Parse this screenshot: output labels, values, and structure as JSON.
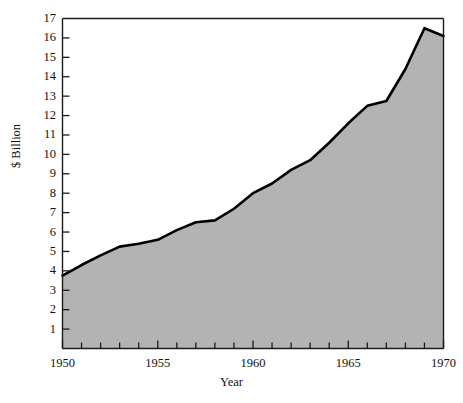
{
  "chart_data": {
    "type": "area",
    "title": "",
    "xlabel": "Year",
    "ylabel": "$ Billion",
    "xlim": [
      1950,
      1970
    ],
    "ylim": [
      0,
      17
    ],
    "grid": false,
    "legend": null,
    "fill_color": "#b3b3b3",
    "line_color": "#000000",
    "background_color": "#ffffff",
    "x_tick_labels": [
      "1950",
      "1955",
      "1960",
      "1965",
      "1970"
    ],
    "x_tick_values": [
      1950,
      1955,
      1960,
      1965,
      1970
    ],
    "x_minor_ticks": [
      1951,
      1952,
      1953,
      1954,
      1956,
      1957,
      1958,
      1959,
      1961,
      1962,
      1963,
      1964,
      1966,
      1967,
      1968,
      1969
    ],
    "y_tick_labels": [
      "1",
      "2",
      "3",
      "4",
      "5",
      "6",
      "7",
      "8",
      "9",
      "10",
      "11",
      "12",
      "13",
      "14",
      "15",
      "16",
      "17"
    ],
    "y_tick_values": [
      1,
      2,
      3,
      4,
      5,
      6,
      7,
      8,
      9,
      10,
      11,
      12,
      13,
      14,
      15,
      16,
      17
    ],
    "x": [
      1950,
      1951,
      1952,
      1953,
      1954,
      1955,
      1956,
      1957,
      1958,
      1959,
      1960,
      1961,
      1962,
      1963,
      1964,
      1965,
      1966,
      1967,
      1968,
      1969,
      1970
    ],
    "values": [
      3.75,
      4.3,
      4.8,
      5.25,
      5.4,
      5.6,
      6.1,
      6.5,
      6.6,
      7.2,
      8.0,
      8.5,
      9.2,
      9.7,
      10.6,
      11.6,
      12.5,
      12.75,
      14.4,
      16.5,
      16.1
    ],
    "series": [
      {
        "name": "$ Billion",
        "values": [
          3.75,
          4.3,
          4.8,
          5.25,
          5.4,
          5.6,
          6.1,
          6.5,
          6.6,
          7.2,
          8.0,
          8.5,
          9.2,
          9.7,
          10.6,
          11.6,
          12.5,
          12.75,
          14.4,
          16.5,
          16.1
        ]
      }
    ]
  }
}
